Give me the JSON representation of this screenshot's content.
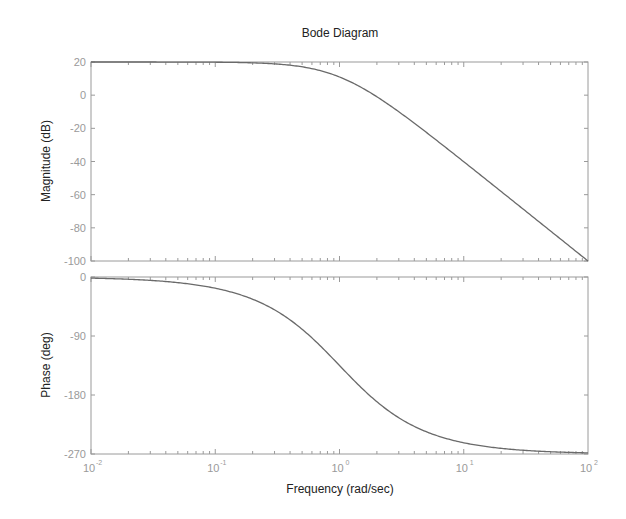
{
  "figure": {
    "title": "Bode Diagram",
    "xlabel": "Frequency  (rad/sec)",
    "background": "#ffffff",
    "axis_color": "#9a9a9a",
    "curve_color": "#6a6a6a"
  },
  "chart_data": [
    {
      "type": "line",
      "panel": "magnitude",
      "title": "Bode Diagram",
      "xlabel": "Frequency  (rad/sec)",
      "ylabel": "Magnitude (dB)",
      "xscale": "log",
      "xlim": [
        0.01,
        100
      ],
      "ylim": [
        -100,
        20
      ],
      "xticks": [
        0.01,
        0.1,
        1,
        10,
        100
      ],
      "xtick_labels": [
        "10^-2",
        "10^-1",
        "10^0",
        "10^1",
        "10^2"
      ],
      "yticks": [
        20,
        0,
        -20,
        -40,
        -60,
        -80,
        -100
      ],
      "ytick_labels": [
        "20",
        "0",
        "-20",
        "-40",
        "-60",
        "-80",
        "-100"
      ],
      "grid": false,
      "series": [
        {
          "name": "Magnitude",
          "x": [
            0.01,
            0.1,
            0.3,
            0.5,
            0.7,
            1,
            1.5,
            2,
            3,
            5,
            10,
            20,
            50,
            100
          ],
          "values": [
            20.0,
            19.87,
            18.87,
            17.1,
            15.3,
            10.97,
            5.9,
            0.3,
            -10.0,
            -22.4,
            -40.1,
            -58.0,
            -81.9,
            -100.0
          ]
        }
      ]
    },
    {
      "type": "line",
      "panel": "phase",
      "xlabel": "Frequency  (rad/sec)",
      "ylabel": "Phase (deg)",
      "xscale": "log",
      "xlim": [
        0.01,
        100
      ],
      "ylim": [
        -270,
        0
      ],
      "xticks": [
        0.01,
        0.1,
        1,
        10,
        100
      ],
      "xtick_labels": [
        "10^-2",
        "10^-1",
        "10^0",
        "10^1",
        "10^2"
      ],
      "yticks": [
        0,
        -90,
        -180,
        -270
      ],
      "ytick_labels": [
        "0",
        "-90",
        "-180",
        "-270"
      ],
      "grid": false,
      "series": [
        {
          "name": "Phase",
          "x": [
            0.01,
            0.1,
            0.3,
            0.5,
            0.7,
            1,
            1.5,
            2,
            3,
            5,
            10,
            20,
            50,
            100
          ],
          "values": [
            -1.7,
            -17.1,
            -50.1,
            -79.7,
            -105.0,
            -135.0,
            -169.7,
            -192.1,
            -215.6,
            -236.3,
            -252.9,
            -261.4,
            -266.6,
            -268.3
          ]
        }
      ]
    }
  ]
}
